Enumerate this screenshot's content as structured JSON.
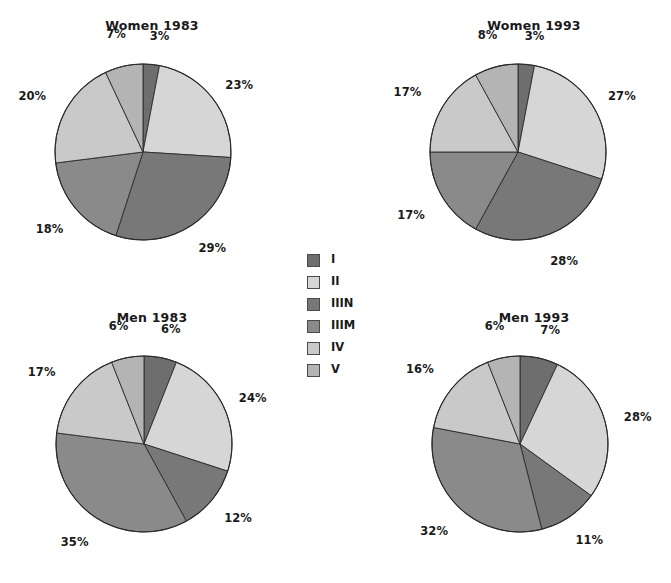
{
  "chart_data": {
    "type": "pie",
    "title": "",
    "legend_position": "center",
    "legend": [
      "I",
      "II",
      "IIIN",
      "IIIM",
      "IV",
      "V"
    ],
    "categories": [
      "I",
      "II",
      "IIIN",
      "IIIM",
      "IV",
      "V"
    ],
    "colors": {
      "I": "#6e6e6e",
      "II": "#d6d6d6",
      "IIIN": "#787878",
      "IIIM": "#8a8a8a",
      "IV": "#c9c9c9",
      "V": "#b4b4b4"
    },
    "value_suffix": "%",
    "charts": [
      {
        "id": "women-1983",
        "title": "Women 1983",
        "categories": [
          "I",
          "II",
          "IIIN",
          "IIIM",
          "IV",
          "V"
        ],
        "values": [
          3,
          23,
          29,
          18,
          20,
          7
        ],
        "labels": [
          "3%",
          "23%",
          "29%",
          "18%",
          "20%",
          "7%"
        ]
      },
      {
        "id": "women-1993",
        "title": "Women 1993",
        "categories": [
          "I",
          "II",
          "IIIN",
          "IIIM",
          "IV",
          "V"
        ],
        "values": [
          3,
          27,
          28,
          17,
          17,
          8
        ],
        "labels": [
          "3%",
          "27%",
          "28%",
          "17%",
          "17%",
          "8%"
        ]
      },
      {
        "id": "men-1983",
        "title": "Men 1983",
        "categories": [
          "I",
          "II",
          "IIIN",
          "IIIM",
          "IV",
          "V"
        ],
        "values": [
          6,
          24,
          12,
          35,
          17,
          6
        ],
        "labels": [
          "6%",
          "24%",
          "12%",
          "35%",
          "17%",
          "6%"
        ]
      },
      {
        "id": "men-1993",
        "title": "Men 1993",
        "categories": [
          "I",
          "II",
          "IIIN",
          "IIIM",
          "IV",
          "V"
        ],
        "values": [
          7,
          28,
          11,
          32,
          16,
          6
        ],
        "labels": [
          "7%",
          "28%",
          "11%",
          "32%",
          "16%",
          "6%"
        ]
      }
    ]
  },
  "panels": {
    "women_1983": {
      "title": "Women 1983"
    },
    "women_1993": {
      "title": "Women 1993"
    },
    "men_1983": {
      "title": "Men 1983"
    },
    "men_1993": {
      "title": "Men 1993"
    }
  },
  "legend": {
    "items": [
      {
        "label": "I",
        "color": "#6e6e6e"
      },
      {
        "label": "II",
        "color": "#d6d6d6"
      },
      {
        "label": "IIIN",
        "color": "#787878"
      },
      {
        "label": "IIIM",
        "color": "#8a8a8a"
      },
      {
        "label": "IV",
        "color": "#c9c9c9"
      },
      {
        "label": "V",
        "color": "#b4b4b4"
      }
    ]
  }
}
